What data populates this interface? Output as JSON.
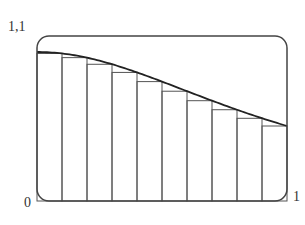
{
  "labels": {
    "y_max": "1,1",
    "x_min": "0",
    "x_max": "1"
  },
  "colors": {
    "frame": "#444444",
    "curve": "#222222",
    "rect": "#555555",
    "text": "#333333"
  },
  "chart_data": {
    "type": "line",
    "title": "",
    "xlabel": "",
    "ylabel": "",
    "function": "f(x) = 1/(1+x^2)",
    "xlim": [
      0,
      1
    ],
    "ylim": [
      0,
      1.1
    ],
    "tick_labels": {
      "x": [
        "0",
        "1"
      ],
      "y": [
        "1,1"
      ]
    },
    "grid": false,
    "legend": null,
    "curve": {
      "x": [
        0,
        0.1,
        0.2,
        0.3,
        0.4,
        0.5,
        0.6,
        0.7,
        0.8,
        0.9,
        1.0
      ],
      "y": [
        1.0,
        0.99,
        0.962,
        0.917,
        0.862,
        0.8,
        0.735,
        0.671,
        0.61,
        0.552,
        0.5
      ]
    },
    "rectangles": {
      "method": "right-endpoint (lower Riemann sum)",
      "n": 10,
      "x_left": [
        0,
        0.1,
        0.2,
        0.3,
        0.4,
        0.5,
        0.6,
        0.7,
        0.8,
        0.9
      ],
      "width": 0.1,
      "heights": [
        0.99,
        0.962,
        0.917,
        0.862,
        0.8,
        0.735,
        0.671,
        0.61,
        0.552,
        0.5
      ]
    }
  }
}
